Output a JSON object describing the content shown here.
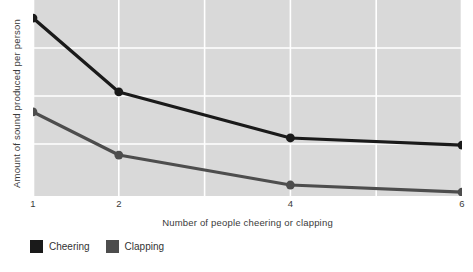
{
  "chart_data": {
    "type": "line",
    "title": "",
    "xlabel": "Number of people cheering or clapping",
    "ylabel": "Amount of sound produced per person",
    "x": [
      1,
      2,
      4,
      6
    ],
    "xticklabels": [
      "1",
      "2",
      "4",
      "6"
    ],
    "xlim": [
      1,
      6
    ],
    "ylim": [
      0,
      1
    ],
    "yticklabels": [],
    "grid": true,
    "legend_position": "below-left",
    "series": [
      {
        "name": "Cheering",
        "color": "#1a1a1a",
        "values": [
          0.908,
          0.531,
          0.296,
          0.26
        ]
      },
      {
        "name": "Clapping",
        "color": "#4d4d4d",
        "values": [
          0.429,
          0.209,
          0.056,
          0.02
        ]
      }
    ]
  },
  "legend": {
    "items": [
      {
        "label": "Cheering",
        "swatch_name": "legend-swatch-cheering"
      },
      {
        "label": "Clapping",
        "swatch_name": "legend-swatch-clapping"
      }
    ]
  },
  "colors": {
    "plot_background": "#d9d9d9",
    "gridline": "#ffffff",
    "page_background": "#ffffff",
    "text": "#333333"
  }
}
